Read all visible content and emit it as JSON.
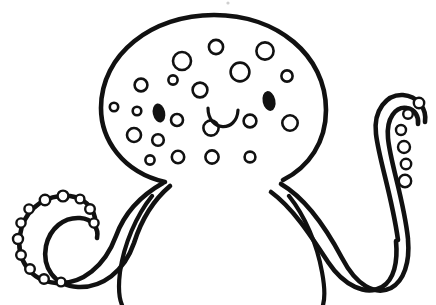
{
  "image": {
    "title": "Octopus line-art coloring page",
    "subject": "octopus",
    "style": "black-and-white line drawing / coloring book outline",
    "background_color": "#ffffff",
    "ink_color": "#111111",
    "canvas": {
      "width": 436,
      "height": 305
    }
  },
  "drawing": {
    "head": {
      "name": "octopus head",
      "description": "large rounded dome (mantle) occupying the upper centre of the frame",
      "stroke_width": 4.6,
      "bounds": {
        "left": 100,
        "top": 14,
        "right": 326,
        "bottom": 195
      },
      "path": "M 165 182 C 122 172 101 139 101 108 C 101 54 152 15 214 15 C 277 15 326 55 326 110 C 326 142 309 167 283 180"
    },
    "face": {
      "left_eye": {
        "name": "left eye",
        "fill": "#111111",
        "cx": 159,
        "cy": 113,
        "rx": 6.2,
        "ry": 9.6,
        "rotation": -12
      },
      "right_eye": {
        "name": "right eye",
        "fill": "#111111",
        "cx": 269,
        "cy": 101,
        "rx": 6.4,
        "ry": 10.0,
        "rotation": -12
      },
      "mouth": {
        "name": "smiling mouth",
        "description": "shallow U-shaped open smile arc",
        "stroke_width": 3.2,
        "path": "M 208 108 C 208 132 237 133 238 110"
      }
    },
    "spots": {
      "name": "head spots",
      "description": "hollow outlined circles scattered across the mantle",
      "count": 20,
      "fill": "#ffffff",
      "stroke": "#111111",
      "items": [
        {
          "cx": 141,
          "cy": 85,
          "r": 6.4
        },
        {
          "cx": 173,
          "cy": 80,
          "r": 4.6
        },
        {
          "cx": 182,
          "cy": 61,
          "r": 9.0
        },
        {
          "cx": 216,
          "cy": 47,
          "r": 7.1
        },
        {
          "cx": 200,
          "cy": 90,
          "r": 7.4
        },
        {
          "cx": 240,
          "cy": 72,
          "r": 9.4
        },
        {
          "cx": 265,
          "cy": 51,
          "r": 8.6
        },
        {
          "cx": 287,
          "cy": 76,
          "r": 5.6
        },
        {
          "cx": 137,
          "cy": 111,
          "r": 4.3
        },
        {
          "cx": 134,
          "cy": 135,
          "r": 7.0
        },
        {
          "cx": 158,
          "cy": 140,
          "r": 5.8
        },
        {
          "cx": 177,
          "cy": 120,
          "r": 6.0
        },
        {
          "cx": 211,
          "cy": 128,
          "r": 7.6
        },
        {
          "cx": 250,
          "cy": 121,
          "r": 6.4
        },
        {
          "cx": 290,
          "cy": 123,
          "r": 7.7
        },
        {
          "cx": 150,
          "cy": 160,
          "r": 4.6
        },
        {
          "cx": 178,
          "cy": 157,
          "r": 6.2
        },
        {
          "cx": 212,
          "cy": 157,
          "r": 6.6
        },
        {
          "cx": 250,
          "cy": 157,
          "r": 5.4
        },
        {
          "cx": 114,
          "cy": 107,
          "r": 4.2
        }
      ]
    },
    "tentacles": [
      {
        "name": "left spiral tentacle",
        "description": "sweeps down-left from the head and coils into a tight inward spiral; suckers line the outer edge",
        "stroke_width": 4.6,
        "outer_path": "M 163 183 C 140 196 124 214 116 236 C 105 266 82 285 56 283 C 30 281 16 259 20 235 C 23 213 40 198 60 196 C 78 194 92 203 95 218",
        "inner_path": "M 170 186 C 150 203 140 224 134 243 C 124 272 102 288 78 287 C 54 286 42 267 46 246 C 50 228 64 217 80 218 C 93 219 99 229 97 238"
      },
      {
        "name": "left inner tentacle",
        "description": "short tapering arm tucked under the head, ending in a point near centre",
        "stroke_width": 4.2,
        "outer_path": "M 152 196 C 136 216 124 244 120 272 C 118 288 119 298 122 305"
      },
      {
        "name": "right lower tentacle",
        "description": "sweeps down-right from the head, dips into a deep U and rises again",
        "stroke_width": 4.6,
        "outer_path": "M 281 184 C 305 198 325 226 342 258 C 356 285 375 296 391 288 C 404 281 410 262 408 240",
        "inner_path": "M 271 192 C 293 208 311 236 328 262 C 344 286 366 296 382 287 C 394 280 398 262 396 241"
      },
      {
        "name": "right upper tentacle",
        "description": "rises from behind the head, arcs up and curls over at the top right; suckers descend its inner edge",
        "stroke_width": 4.6,
        "outer_path": "M 398 240 C 392 196 379 160 376 134 C 373 110 387 94 403 95 C 417 96 427 108 425 122",
        "inner_path": "M 408 239 C 404 200 390 162 388 138 C 386 118 396 106 407 108 C 415 109 419 117 418 124"
      },
      {
        "name": "right inner tentacle",
        "description": "short tapering arm under the head curving down-right to a point",
        "stroke_width": 4.2,
        "outer_path": "M 289 196 C 305 216 317 244 322 272 C 325 288 325 298 323 305"
      }
    ],
    "suckers": {
      "name": "tentacle suckers",
      "description": "small hollow circles strung along the tentacle edges",
      "fill": "#ffffff",
      "stroke": "#111111",
      "left_arm": [
        {
          "cx": 45,
          "cy": 200,
          "r": 5.2
        },
        {
          "cx": 29,
          "cy": 209,
          "r": 4.6
        },
        {
          "cx": 21,
          "cy": 223,
          "r": 4.6
        },
        {
          "cx": 18,
          "cy": 239,
          "r": 5.0
        },
        {
          "cx": 21,
          "cy": 255,
          "r": 4.8
        },
        {
          "cx": 30,
          "cy": 269,
          "r": 4.8
        },
        {
          "cx": 44,
          "cy": 279,
          "r": 4.8
        },
        {
          "cx": 61,
          "cy": 282,
          "r": 4.4
        },
        {
          "cx": 63,
          "cy": 196,
          "r": 5.4
        },
        {
          "cx": 80,
          "cy": 199,
          "r": 4.4
        },
        {
          "cx": 90,
          "cy": 209,
          "r": 4.8
        },
        {
          "cx": 94,
          "cy": 223,
          "r": 4.6
        }
      ],
      "right_arm": [
        {
          "cx": 419,
          "cy": 103,
          "r": 5.2
        },
        {
          "cx": 408,
          "cy": 114,
          "r": 4.8
        },
        {
          "cx": 401,
          "cy": 130,
          "r": 5.0
        },
        {
          "cx": 404,
          "cy": 147,
          "r": 6.0
        },
        {
          "cx": 406,
          "cy": 164,
          "r": 5.2
        },
        {
          "cx": 405,
          "cy": 181,
          "r": 6.2
        }
      ]
    },
    "artifacts": [
      {
        "name": "top speck",
        "cx": 228,
        "cy": 3,
        "r": 1.6
      }
    ]
  }
}
